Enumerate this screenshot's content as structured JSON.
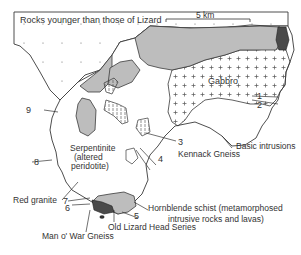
{
  "diagram": {
    "type": "geological-map",
    "colors": {
      "outline": "#3a3a3a",
      "younger_rocks": "#ffffff",
      "gabbro_dots": "#555555",
      "grey_unit": "#bdbdbd",
      "dark_unit": "#4a4a4a",
      "serpentinite": "#ffffff"
    },
    "scale_bar": {
      "label": "5 km"
    },
    "region_labels": {
      "younger": "Rocks younger than those of Lizard",
      "gabbro": "Gabbro",
      "serpentinite_1": "Serpentinite",
      "serpentinite_2": "(altered",
      "serpentinite_3": "peridotite)"
    },
    "callouts": {
      "basic_intrusions": "Basic intrusions",
      "kennack_gneiss": "Kennack Gneiss",
      "red_granite": "Red granite",
      "man_o_war": "Man o' War Gneiss",
      "old_lizard": "Old Lizard Head Series",
      "hornblende_1": "Hornblende schist (metamorphosed",
      "hornblende_2": "intrusive rocks and lavas)"
    },
    "numbers": {
      "n1": "1",
      "n2": "2",
      "n3": "3",
      "n4": "4",
      "n5": "5",
      "n6": "6",
      "n7": "7",
      "n8": "8",
      "n9": "9"
    }
  }
}
